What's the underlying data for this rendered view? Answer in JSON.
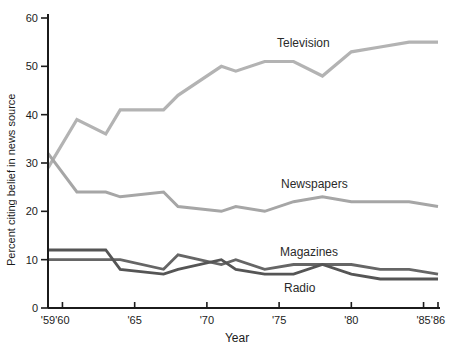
{
  "chart_data": {
    "type": "line",
    "title": "",
    "xlabel": "Year",
    "ylabel": "Percent citing belief in news source",
    "xlim": [
      1959,
      1986
    ],
    "ylim": [
      0,
      60
    ],
    "grid": false,
    "legend": "inline-labels-next-to-lines",
    "y_ticks": [
      0,
      10,
      20,
      30,
      40,
      50,
      60
    ],
    "x_ticks": [
      {
        "year": 1959,
        "label": "'59"
      },
      {
        "year": 1960,
        "label": "'60"
      },
      {
        "year": 1965,
        "label": "'65"
      },
      {
        "year": 1970,
        "label": "'70"
      },
      {
        "year": 1975,
        "label": "'75"
      },
      {
        "year": 1980,
        "label": "'80"
      },
      {
        "year": 1985,
        "label": "'85"
      },
      {
        "year": 1986,
        "label": "'86"
      }
    ],
    "x": [
      1959,
      1961,
      1963,
      1964,
      1967,
      1968,
      1971,
      1972,
      1974,
      1976,
      1978,
      1980,
      1982,
      1984,
      1986
    ],
    "series": [
      {
        "name": "Television",
        "color": "#b3b3b3",
        "stroke_width": 3.2,
        "values": [
          29,
          39,
          36,
          41,
          41,
          44,
          50,
          49,
          51,
          51,
          48,
          53,
          54,
          55,
          55
        ]
      },
      {
        "name": "Newspapers",
        "color": "#a6a6a6",
        "stroke_width": 3.0,
        "values": [
          32,
          24,
          24,
          23,
          24,
          21,
          20,
          21,
          20,
          22,
          23,
          22,
          22,
          22,
          21
        ]
      },
      {
        "name": "Magazines",
        "color": "#666666",
        "stroke_width": 2.8,
        "values": [
          10,
          10,
          10,
          10,
          8,
          11,
          9,
          10,
          8,
          9,
          9,
          9,
          8,
          8,
          7
        ]
      },
      {
        "name": "Radio",
        "color": "#555555",
        "stroke_width": 2.8,
        "values": [
          12,
          12,
          12,
          8,
          7,
          8,
          10,
          8,
          7,
          7,
          9,
          7,
          6,
          6,
          6
        ]
      }
    ],
    "axis_color": "#1b1b1b"
  }
}
